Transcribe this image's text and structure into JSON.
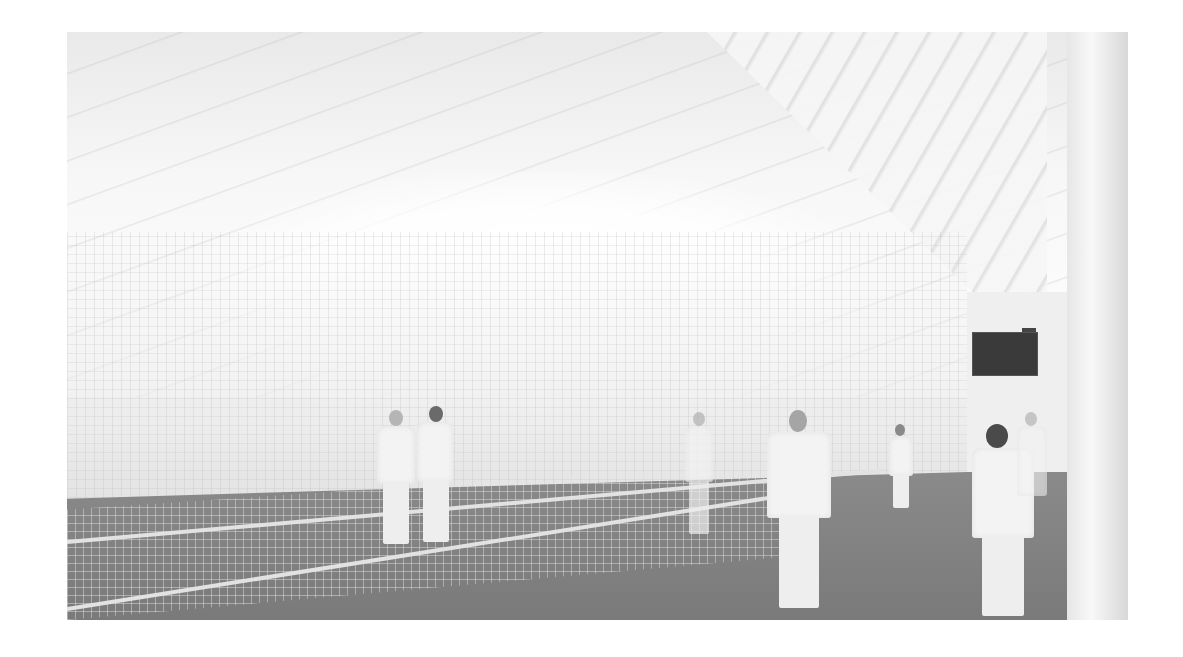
{
  "image": {
    "description": "Grayscale photograph of an indoor cricket training centre with long netted lanes, bright fabric ceiling, and players in white",
    "scene": "indoor cricket nets",
    "elements": [
      "fabric ceiling",
      "net curtains",
      "practice lanes",
      "cricket players in whites",
      "scoreboard",
      "white pillar"
    ],
    "colors": {
      "background": "#ffffff",
      "ceiling": "#f4f4f4",
      "floor": "#7f7f7f",
      "scoreboard": "#3a3a3a"
    }
  }
}
